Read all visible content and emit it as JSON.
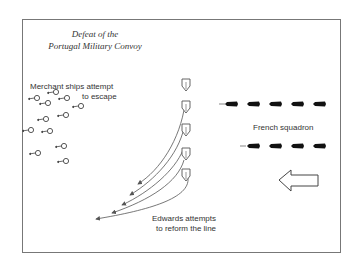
{
  "title": {
    "line1": "Defeat of the",
    "line2": "Portugal Military Convoy"
  },
  "labels": {
    "merchant_line1": "Merchant ships attempt",
    "merchant_line2": "to escape",
    "french": "French squadron",
    "edwards_line1": "Edwards attempts",
    "edwards_line2": "to reform the line"
  },
  "icons": {
    "merchant_ship": "circle-with-arrow-left",
    "british_ship": "shield-ship-outline",
    "french_ship": "black-ship-left",
    "direction": "hollow-arrow-left"
  },
  "colors": {
    "line": "#555555",
    "french_ship": "#111111",
    "text": "#333333"
  }
}
